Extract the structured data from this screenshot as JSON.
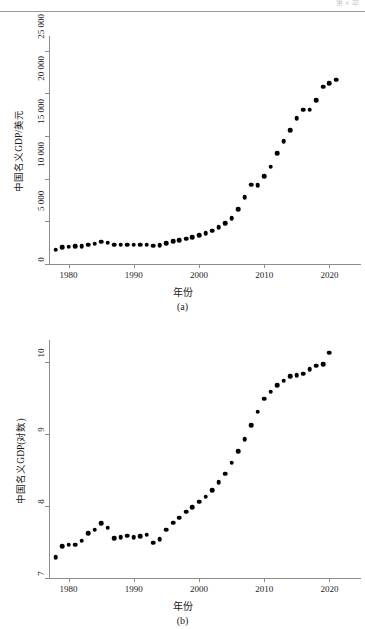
{
  "page": {
    "header_text": "第 4 章",
    "background": "#ffffff",
    "point_color": "#000000",
    "axis_color": "#8c8c8c"
  },
  "figures": [
    {
      "id": "a",
      "caption": "(a)",
      "xlabel": "年份",
      "ylabel": "中国名义GDP/美元",
      "y_ticks": [
        "0",
        "5 000",
        "10 000",
        "15 000",
        "20 000",
        "25 000"
      ],
      "x_ticks": [
        "1980",
        "1990",
        "2000",
        "2010",
        "2020"
      ]
    },
    {
      "id": "b",
      "caption": "(b)",
      "xlabel": "年份",
      "ylabel": "中国名义GDP(对数)",
      "y_ticks": [
        "7",
        "8",
        "9",
        "10"
      ],
      "x_ticks": [
        "1980",
        "1990",
        "2000",
        "2010",
        "2020"
      ]
    }
  ],
  "chart_data": [
    {
      "type": "scatter",
      "id": "a",
      "title": "",
      "xlabel": "年份",
      "ylabel": "中国名义GDP/美元",
      "xlim": [
        1977,
        2023
      ],
      "ylim": [
        0,
        26500
      ],
      "ytick_values": [
        0,
        5000,
        10000,
        15000,
        20000,
        25000
      ],
      "xtick_values": [
        1980,
        1990,
        2000,
        2010,
        2020
      ],
      "grid": false,
      "legend": "none",
      "x": [
        1978,
        1979,
        1980,
        1981,
        1982,
        1983,
        1984,
        1985,
        1986,
        1987,
        1988,
        1989,
        1990,
        1991,
        1992,
        1993,
        1994,
        1995,
        1996,
        1997,
        1998,
        1999,
        2000,
        2001,
        2002,
        2003,
        2004,
        2005,
        2006,
        2007,
        2008,
        2009,
        2010,
        2011,
        2012,
        2013,
        2014,
        2015,
        2016,
        2017,
        2018,
        2019,
        2020,
        2021
      ],
      "y": [
        1495,
        1780,
        1900,
        1960,
        2050,
        2300,
        2590,
        3090,
        3010,
        2730,
        2710,
        2740,
        2700,
        2760,
        2770,
        2440,
        2670,
        3210,
        3520,
        3780,
        4020,
        4330,
        4700,
        5080,
        5600,
        6400,
        7400,
        9000,
        11000,
        13500,
        16500,
        18500,
        22000,
        25000,
        27500,
        30000,
        32500,
        34000,
        34000,
        36000,
        39000,
        41000,
        42000,
        48000
      ],
      "y_display_note": "values read from axis in units shown on plot (0 to 25 000)",
      "y_plot": [
        1700,
        1980,
        2050,
        2080,
        2120,
        2250,
        2400,
        2630,
        2520,
        2250,
        2260,
        2270,
        2250,
        2270,
        2250,
        2130,
        2170,
        2450,
        2650,
        2800,
        2950,
        3120,
        3350,
        3600,
        3900,
        4280,
        4750,
        5350,
        6450,
        7800,
        9300,
        9250,
        10300,
        11400,
        13000,
        14400,
        15700,
        17100,
        18100,
        18100,
        19200,
        20800,
        21200,
        21600,
        24900
      ]
    },
    {
      "type": "scatter",
      "id": "b",
      "title": "",
      "xlabel": "年份",
      "ylabel": "中国名义GDP(对数)",
      "xlim": [
        1977,
        2023
      ],
      "ylim": [
        7,
        10.25
      ],
      "ytick_values": [
        7,
        8,
        9,
        10
      ],
      "xtick_values": [
        1980,
        1990,
        2000,
        2010,
        2020
      ],
      "grid": false,
      "legend": "none",
      "x": [
        1978,
        1979,
        1980,
        1981,
        1982,
        1983,
        1984,
        1985,
        1986,
        1987,
        1988,
        1989,
        1990,
        1991,
        1992,
        1993,
        1994,
        1995,
        1996,
        1997,
        1998,
        1999,
        2000,
        2001,
        2002,
        2003,
        2004,
        2005,
        2006,
        2007,
        2008,
        2009,
        2010,
        2011,
        2012,
        2013,
        2014,
        2015,
        2016,
        2017,
        2018,
        2019,
        2020
      ],
      "y": [
        7.29,
        7.44,
        7.46,
        7.46,
        7.52,
        7.62,
        7.67,
        7.76,
        7.7,
        7.55,
        7.57,
        7.59,
        7.57,
        7.58,
        7.6,
        7.49,
        7.54,
        7.67,
        7.77,
        7.84,
        7.92,
        7.98,
        8.06,
        8.13,
        8.22,
        8.33,
        8.45,
        8.6,
        8.76,
        8.93,
        9.12,
        9.31,
        9.49,
        9.59,
        9.68,
        9.74,
        9.8,
        9.82,
        9.84,
        9.9,
        9.95,
        9.97,
        10.13
      ]
    }
  ]
}
